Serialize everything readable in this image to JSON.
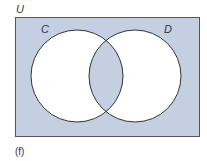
{
  "diagram": {
    "type": "venn",
    "universe_label": "U",
    "sets": [
      {
        "label": "C"
      },
      {
        "label": "D"
      }
    ],
    "shaded_regions": [
      "outside C and D",
      "C ∩ D"
    ],
    "caption": "(f)",
    "colors": {
      "shade": "#c5cfe2",
      "circle_fill": "#ffffff",
      "stroke": "#333333"
    }
  }
}
